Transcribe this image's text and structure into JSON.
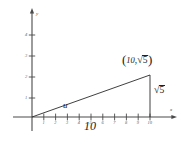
{
  "figure": {
    "type": "geometry-diagram",
    "axes": {
      "x_label": "x",
      "y_label": "y",
      "x_ticks": [
        "1",
        "2",
        "3",
        "4",
        "5",
        "6",
        "7",
        "8",
        "9",
        "10"
      ],
      "y_ticks": [
        "1",
        "2",
        "3",
        "4"
      ],
      "x_range": [
        0,
        11
      ],
      "y_range": [
        0,
        4.6
      ]
    },
    "labels": {
      "hypotenuse": "u",
      "base": "10",
      "vertical_leg_sign": "√",
      "vertical_leg_value": "5",
      "point_open_paren": "(",
      "point_x": "10",
      "point_comma": ",",
      "point_radical": "√",
      "point_radical_value": "5",
      "point_close_paren": ")"
    },
    "colors": {
      "line": "#2a2a2a",
      "axis": "#4a4a4a",
      "text": "#1d1d1d",
      "background": "#ffffff"
    },
    "geometry": {
      "origin": [
        32,
        117
      ],
      "apex": [
        150,
        75
      ],
      "foot": [
        150,
        117
      ]
    }
  }
}
